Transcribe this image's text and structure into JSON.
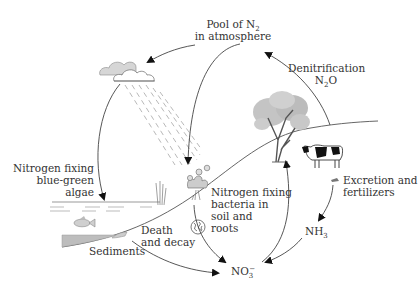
{
  "diagram": {
    "colors": {
      "line": "#444444",
      "text": "#333333",
      "rain": "#8a8a8a",
      "cloud_fill": "#ffffff",
      "cloud_shadow": "#cfcfcf",
      "sediment": "#bdbdbd",
      "foliage": "#b9b9b9",
      "cow": "#111111",
      "water": "#9a9a9a"
    },
    "labels": {
      "pool": {
        "line1_prefix": "Pool of N",
        "line1_sub": "2",
        "line2": "in atmosphere"
      },
      "denitrification": {
        "line1": "Denitrification",
        "line2_prefix": "N",
        "line2_sub": "2",
        "line2_suffix": "O"
      },
      "algae": {
        "line1": "Nitrogen fixing",
        "line2": "blue-green",
        "line3": "algae"
      },
      "bacteria": {
        "line1": "Nitrogen fixing",
        "line2": "bacteria in",
        "line3": "soil and",
        "line4": "roots"
      },
      "excretion": {
        "line1": "Excretion and",
        "line2": "fertilizers"
      },
      "ammonia": {
        "prefix": "NH",
        "sub": "3"
      },
      "nitrate": {
        "prefix": "NO",
        "sub": "3",
        "sup": "−"
      },
      "decay": {
        "line1": "Death",
        "line2": "and decay"
      },
      "sediments": "Sediments"
    },
    "elements": [
      "cloud-icon",
      "rain-icon",
      "tree-icon",
      "cow-icon",
      "flower-plant-icon",
      "reed-icon",
      "fish-icon",
      "bacteria-icon",
      "manure-icon",
      "sediment-icon"
    ],
    "arrows": [
      {
        "from": "pool",
        "to": "cloud"
      },
      {
        "from": "pool",
        "to": "bacteria-plant"
      },
      {
        "from": "cloud",
        "to": "algae-water"
      },
      {
        "from": "tree",
        "to": "pool",
        "label": "denitrification"
      },
      {
        "from": "bacteria",
        "to": "nitrate"
      },
      {
        "from": "sediments",
        "to": "nitrate",
        "label": "decay"
      },
      {
        "from": "nitrate",
        "to": "tree"
      },
      {
        "from": "excretion",
        "to": "ammonia"
      },
      {
        "from": "ammonia",
        "to": "nitrate"
      }
    ]
  }
}
